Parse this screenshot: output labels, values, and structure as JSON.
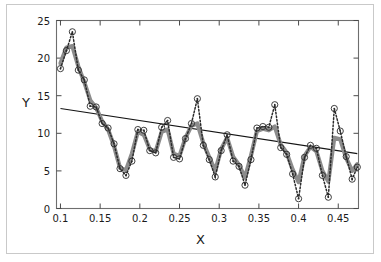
{
  "chart_data": {
    "type": "line",
    "title": "",
    "xlabel": "X",
    "ylabel": "Y",
    "xlim": [
      0.095,
      0.4755
    ],
    "ylim": [
      0,
      25
    ],
    "grid": false,
    "legend": null,
    "xticks": [
      0.1,
      0.15,
      0.2,
      0.25,
      0.3,
      0.35,
      0.4,
      0.45
    ],
    "xtick_labels": [
      "0.1",
      "0.15",
      "0.2",
      "0.25",
      "0.3",
      "0.35",
      "0.4",
      "0.45"
    ],
    "yticks": [
      0,
      5,
      10,
      15,
      20,
      25
    ],
    "ytick_labels": [
      "0",
      "5",
      "10",
      "15",
      "20",
      "25"
    ],
    "series": [
      {
        "name": "observed-data",
        "style": "dotted-with-open-circle-markers",
        "color": "#2a2a2a",
        "marker": "open-circle",
        "x": [
          0.1,
          0.1075,
          0.115,
          0.1225,
          0.13,
          0.1375,
          0.145,
          0.1525,
          0.16,
          0.1675,
          0.175,
          0.1825,
          0.19,
          0.1975,
          0.205,
          0.2125,
          0.22,
          0.2275,
          0.235,
          0.2425,
          0.25,
          0.2575,
          0.265,
          0.2725,
          0.28,
          0.2875,
          0.295,
          0.3025,
          0.31,
          0.3175,
          0.325,
          0.3325,
          0.34,
          0.3475,
          0.355,
          0.3625,
          0.37,
          0.3775,
          0.385,
          0.3925,
          0.4,
          0.4075,
          0.415,
          0.4225,
          0.43,
          0.4375,
          0.445,
          0.4525,
          0.46,
          0.4675,
          0.474
        ],
        "y": [
          18.6,
          21.0,
          23.5,
          18.4,
          17.1,
          13.6,
          13.5,
          11.3,
          10.7,
          8.6,
          5.3,
          4.4,
          6.3,
          10.5,
          10.4,
          7.7,
          7.4,
          10.8,
          11.7,
          6.8,
          6.6,
          9.3,
          11.3,
          14.6,
          8.4,
          6.5,
          4.2,
          7.7,
          9.8,
          6.3,
          5.6,
          3.1,
          6.5,
          10.7,
          10.9,
          10.8,
          13.8,
          8.1,
          7.2,
          4.6,
          1.3,
          6.8,
          8.4,
          8.0,
          4.4,
          1.5,
          13.3,
          10.3,
          6.9,
          3.9,
          5.5
        ]
      },
      {
        "name": "smoothed-fit",
        "style": "thick-solid-grey",
        "color": "#8c8c8c",
        "x": [
          0.1,
          0.1075,
          0.115,
          0.1225,
          0.13,
          0.1375,
          0.145,
          0.1525,
          0.16,
          0.1675,
          0.175,
          0.1825,
          0.19,
          0.1975,
          0.205,
          0.2125,
          0.22,
          0.2275,
          0.235,
          0.2425,
          0.25,
          0.2575,
          0.265,
          0.2725,
          0.28,
          0.2875,
          0.295,
          0.3025,
          0.31,
          0.3175,
          0.325,
          0.3325,
          0.34,
          0.3475,
          0.355,
          0.3625,
          0.37,
          0.3775,
          0.385,
          0.3925,
          0.4,
          0.4075,
          0.415,
          0.4225,
          0.43,
          0.4375,
          0.445,
          0.4525,
          0.46,
          0.4675,
          0.474
        ],
        "y": [
          19.3,
          21.4,
          21.6,
          18.9,
          16.8,
          14.4,
          13.4,
          11.6,
          10.5,
          8.3,
          5.4,
          5.1,
          7.3,
          10.2,
          9.8,
          7.9,
          7.6,
          10.2,
          10.5,
          7.3,
          7.0,
          9.4,
          11.0,
          11.3,
          8.7,
          6.8,
          5.0,
          7.9,
          9.4,
          6.9,
          5.8,
          4.1,
          7.0,
          10.3,
          10.6,
          10.4,
          10.9,
          8.5,
          7.4,
          5.2,
          3.5,
          7.0,
          8.2,
          7.6,
          5.0,
          3.6,
          9.4,
          9.2,
          6.7,
          5.0,
          5.9
        ]
      },
      {
        "name": "linear-trend",
        "style": "thin-solid-black",
        "color": "#141414",
        "x": [
          0.1,
          0.474
        ],
        "y": [
          13.3,
          7.3
        ]
      }
    ]
  }
}
